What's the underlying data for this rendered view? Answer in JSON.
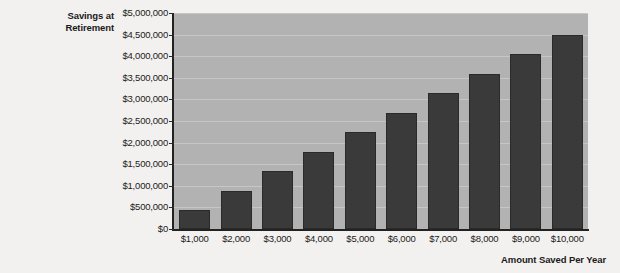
{
  "chart_data": {
    "type": "bar",
    "title": "",
    "subtitle": "",
    "ylabel": "Savings at Retirement",
    "xlabel": "Amount Saved Per Year",
    "categories": [
      "$1,000",
      "$2,000",
      "$3,000",
      "$4,000",
      "$5,000",
      "$6,000",
      "$7,000",
      "$8,000",
      "$9,000",
      "$10,000"
    ],
    "values": [
      450000,
      890000,
      1340000,
      1790000,
      2240000,
      2690000,
      3140000,
      3590000,
      4050000,
      4500000
    ],
    "ylim": [
      0,
      5000000
    ],
    "ytick_values": [
      0,
      500000,
      1000000,
      1500000,
      2000000,
      2500000,
      3000000,
      3500000,
      4000000,
      4500000,
      5000000
    ],
    "ytick_labels": [
      "$0",
      "$500,000",
      "$1,000,000",
      "$1,500,000",
      "$2,000,000",
      "$2,500,000",
      "$3,000,000",
      "$3,500,000",
      "$4,000,000",
      "$4,500,000",
      "$5,000,000"
    ],
    "grid": true,
    "legend": null,
    "legend_position": "none",
    "series": [
      {
        "name": "Savings at Retirement",
        "values": [
          450000,
          890000,
          1340000,
          1790000,
          2240000,
          2690000,
          3140000,
          3590000,
          4050000,
          4500000
        ]
      }
    ],
    "colors": {
      "bar": "#3a3a3a",
      "plot_background": "#b2b2b2",
      "gridline": "#c6c6c6",
      "axis": "#222222",
      "page_background": "#f2f1ef",
      "text": "#1b1b1b"
    }
  },
  "axis": {
    "y_title_line1": "Savings at",
    "y_title_line2": "Retirement",
    "x_title": "Amount Saved Per Year"
  }
}
